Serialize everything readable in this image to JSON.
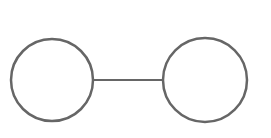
{
  "diagram": {
    "type": "graph",
    "stroke_color": "#666666",
    "background": "#ffffff",
    "nodes": [
      {
        "id": "node-left",
        "cx": 52,
        "cy": 80,
        "r": 41
      },
      {
        "id": "node-right",
        "cx": 205,
        "cy": 80,
        "r": 42
      }
    ],
    "edges": [
      {
        "from": "node-left",
        "to": "node-right",
        "x1": 93,
        "y1": 80,
        "x2": 163,
        "y2": 80
      }
    ]
  }
}
